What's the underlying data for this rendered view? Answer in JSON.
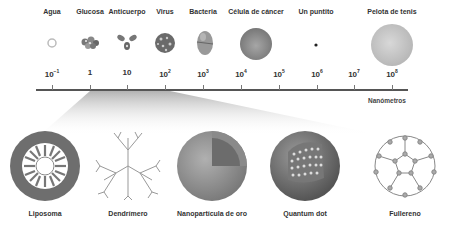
{
  "scale": {
    "unit_label": "Nanómetros",
    "ticks": [
      {
        "base": "10",
        "exp": "−1",
        "x": 52
      },
      {
        "base": "1",
        "exp": "",
        "x": 90
      },
      {
        "base": "10",
        "exp": "",
        "x": 127
      },
      {
        "base": "10",
        "exp": "2",
        "x": 165
      },
      {
        "base": "10",
        "exp": "3",
        "x": 203
      },
      {
        "base": "10",
        "exp": "4",
        "x": 241
      },
      {
        "base": "10",
        "exp": "5",
        "x": 279
      },
      {
        "base": "10",
        "exp": "6",
        "x": 317
      },
      {
        "base": "10",
        "exp": "7",
        "x": 354
      },
      {
        "base": "10",
        "exp": "8",
        "x": 392
      }
    ]
  },
  "objects": [
    {
      "label": "Agua",
      "x": 52
    },
    {
      "label": "Glucosa",
      "x": 90
    },
    {
      "label": "Anticuerpo",
      "x": 127
    },
    {
      "label": "Virus",
      "x": 165
    },
    {
      "label": "Bacteria",
      "x": 203
    },
    {
      "label": "Célula de cáncer",
      "x": 256
    },
    {
      "label": "Un puntito",
      "x": 316
    },
    {
      "label": "Pelota de tenis",
      "x": 392
    }
  ],
  "nanostructures": [
    {
      "label": "Liposoma",
      "x": 45
    },
    {
      "label": "Dendrímero",
      "x": 128
    },
    {
      "label": "Nanopartícula de oro",
      "x": 212
    },
    {
      "label": "Quantum dot",
      "x": 305
    },
    {
      "label": "Fullereno",
      "x": 405
    }
  ],
  "colors": {
    "axis": "#555555",
    "wedge": "#bdbdbd"
  }
}
